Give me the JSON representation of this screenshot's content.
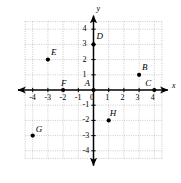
{
  "chart_data": {
    "type": "scatter",
    "title": "",
    "xlabel": "x",
    "ylabel": "y",
    "xlim": [
      -4.5,
      4.5
    ],
    "ylim": [
      -4.5,
      4.5
    ],
    "grid": true,
    "grid_style": "dotted",
    "legend": "none",
    "x_ticks": [
      -4,
      -3,
      -2,
      -1,
      0,
      1,
      2,
      3,
      4
    ],
    "y_ticks": [
      -4,
      -3,
      -2,
      -1,
      1,
      2,
      3,
      4
    ],
    "x_tick_labels": [
      "-4",
      "-3",
      "-2",
      "-1",
      "0",
      "1",
      "2",
      "3",
      "4"
    ],
    "y_tick_labels": [
      "-4",
      "-3",
      "-2",
      "-1",
      "1",
      "2",
      "3",
      "4"
    ],
    "points": [
      {
        "label": "A",
        "x": 0,
        "y": 0,
        "label_dx": -9,
        "label_dy": -11
      },
      {
        "label": "B",
        "x": 3,
        "y": 1,
        "label_dx": 3,
        "label_dy": -12
      },
      {
        "label": "C",
        "x": 4,
        "y": 0,
        "label_dx": -9,
        "label_dy": -11
      },
      {
        "label": "D",
        "x": 0,
        "y": 3,
        "label_dx": 3,
        "label_dy": -12
      },
      {
        "label": "E",
        "x": -3,
        "y": 2,
        "label_dx": 3,
        "label_dy": -12
      },
      {
        "label": "F",
        "x": -2,
        "y": 0,
        "label_dx": -2,
        "label_dy": -11
      },
      {
        "label": "G",
        "x": -4,
        "y": -3,
        "label_dx": 3,
        "label_dy": -11
      },
      {
        "label": "H",
        "x": 1,
        "y": -2,
        "label_dx": 1,
        "label_dy": -11
      }
    ],
    "colors": {
      "axis": "#000000",
      "grid": "#b5b5b5",
      "point": "#000000",
      "background": "#ffffff",
      "text": "#000000"
    }
  },
  "axes": {
    "x_axis_label": "x",
    "y_axis_label": "y"
  }
}
